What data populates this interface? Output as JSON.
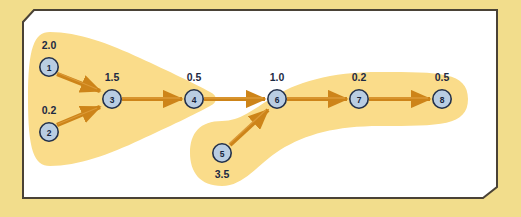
{
  "figure": {
    "background_color": "#f2dd8c",
    "panel_color": "#ffffff",
    "panel_border_color": "#4a4236",
    "cluster_color": "#fadc8a",
    "node_fill": "#b9cde2",
    "node_stroke": "#22304a",
    "edge_color": "#d2891e",
    "label_color": "#1d2a43"
  },
  "graph": {
    "type": "directed-graph",
    "nodes": [
      {
        "id": "1",
        "label": "1",
        "value": "2.0",
        "value_position": "above",
        "cx": 49,
        "cy": 67,
        "cluster": "A"
      },
      {
        "id": "2",
        "label": "2",
        "value": "0.2",
        "value_position": "above",
        "cx": 49,
        "cy": 132,
        "cluster": "A"
      },
      {
        "id": "3",
        "label": "3",
        "value": "1.5",
        "value_position": "above",
        "cx": 112,
        "cy": 99,
        "cluster": "A"
      },
      {
        "id": "4",
        "label": "4",
        "value": "0.5",
        "value_position": "above",
        "cx": 194,
        "cy": 99,
        "cluster": "A"
      },
      {
        "id": "5",
        "label": "5",
        "value": "3.5",
        "value_position": "below",
        "cx": 222,
        "cy": 153,
        "cluster": "B"
      },
      {
        "id": "6",
        "label": "6",
        "value": "1.0",
        "value_position": "above",
        "cx": 277,
        "cy": 99,
        "cluster": "B"
      },
      {
        "id": "7",
        "label": "7",
        "value": "0.2",
        "value_position": "above",
        "cx": 359,
        "cy": 99,
        "cluster": "B"
      },
      {
        "id": "8",
        "label": "8",
        "value": "0.5",
        "value_position": "above",
        "cx": 442,
        "cy": 99,
        "cluster": "B"
      }
    ],
    "edges": [
      {
        "from": "1",
        "to": "3"
      },
      {
        "from": "2",
        "to": "3"
      },
      {
        "from": "3",
        "to": "4"
      },
      {
        "from": "4",
        "to": "6"
      },
      {
        "from": "5",
        "to": "6"
      },
      {
        "from": "6",
        "to": "7"
      },
      {
        "from": "7",
        "to": "8"
      }
    ],
    "clusters": [
      {
        "id": "A",
        "members": [
          "1",
          "2",
          "3",
          "4"
        ],
        "shape": "wedge"
      },
      {
        "id": "B",
        "members": [
          "5",
          "6",
          "7",
          "8"
        ],
        "shape": "boomerang"
      }
    ]
  }
}
